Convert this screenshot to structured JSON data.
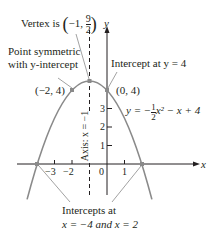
{
  "annotations": {
    "vertex_prefix": "Vertex is",
    "vertex_x": "−1,",
    "vertex_num": "9",
    "vertex_den": "2",
    "symmetric_line1": "Point symmetric",
    "symmetric_line2": "with y-intercept",
    "intercept_y": "Intercept at y = 4",
    "intercepts_x_line1": "Intercepts at",
    "intercepts_x_line2": "x = −4 and x = 2",
    "axis_label": "Axis: x = −1"
  },
  "points": {
    "left": "(−2, 4)",
    "right": "(0, 4)"
  },
  "equation": {
    "lhs": "y = −",
    "num": "1",
    "den": "2",
    "rhs": "x² − x + 4"
  },
  "axes": {
    "x_label": "x",
    "y_label": "y",
    "x_ticks": [
      "−3",
      "−2",
      "0",
      "1"
    ],
    "y_ticks": [
      "3",
      "2",
      "1"
    ]
  },
  "colors": {
    "curve": "#8a8a8a",
    "axis": "#231f20",
    "point": "#8a8a8a"
  }
}
